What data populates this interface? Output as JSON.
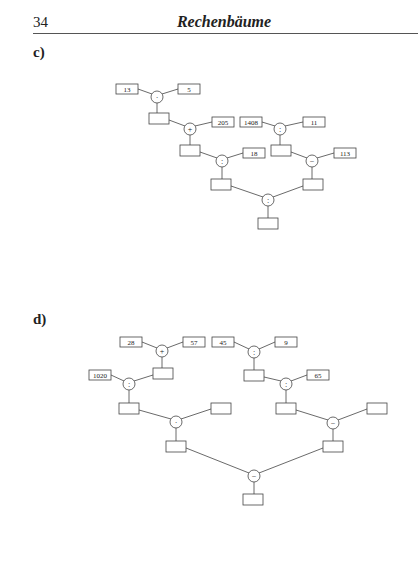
{
  "header": {
    "page_number": "34",
    "title": "Rechenbäume"
  },
  "sections": [
    {
      "label": "c)",
      "nodes": {
        "c_n13": {
          "text": "13"
        },
        "c_n5": {
          "text": "5"
        },
        "c_n205": {
          "text": "205"
        },
        "c_n18": {
          "text": "18"
        },
        "c_n1408": {
          "text": "1408"
        },
        "c_n11": {
          "text": "11"
        },
        "c_n113": {
          "text": "113"
        }
      },
      "operators": {
        "c_op1": "·",
        "c_op2": "+",
        "c_op3": ":",
        "c_op4": ":",
        "c_op5": "−",
        "c_op6": ":"
      }
    },
    {
      "label": "d)",
      "nodes": {
        "d_n28": {
          "text": "28"
        },
        "d_n57": {
          "text": "57"
        },
        "d_n1020": {
          "text": "1020"
        },
        "d_n45": {
          "text": "45"
        },
        "d_n9": {
          "text": "9"
        },
        "d_n65": {
          "text": "65"
        }
      },
      "operators": {
        "d_op1": "+",
        "d_op2": ":",
        "d_op3": "·",
        "d_op4": ":",
        "d_op5": ":",
        "d_op6": "−",
        "d_op7": "−"
      }
    }
  ]
}
